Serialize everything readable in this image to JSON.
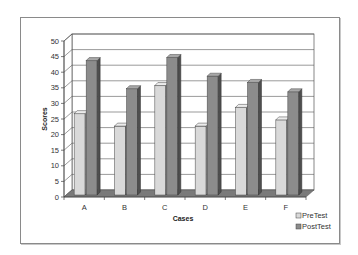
{
  "chart_data": {
    "type": "bar",
    "style": "3d-clustered-column",
    "title": "",
    "xlabel": "Cases",
    "ylabel": "Scores",
    "categories": [
      "A",
      "B",
      "C",
      "D",
      "E",
      "F"
    ],
    "series": [
      {
        "name": "PreTest",
        "values": [
          28,
          24,
          37,
          24,
          30,
          26
        ],
        "color": "#d9d9d9",
        "side_color": "#9a9a9a",
        "top_color": "#ececec"
      },
      {
        "name": "PostTest",
        "values": [
          45,
          36,
          46,
          40,
          38,
          35
        ],
        "color": "#8c8c8c",
        "side_color": "#4e4e4e",
        "top_color": "#a8a8a8"
      }
    ],
    "ylim": [
      0,
      50
    ],
    "yticks": [
      0,
      5,
      10,
      15,
      20,
      25,
      30,
      35,
      40,
      45,
      50
    ],
    "grid": true,
    "legend_position": "bottom-right",
    "floor_color": "#7a7a7a",
    "grid_color": "#555555"
  }
}
